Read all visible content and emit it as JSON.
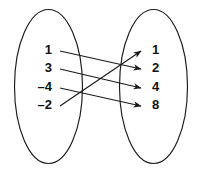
{
  "figure": {
    "kind": "mapping-diagram",
    "background_color": "#ffffff",
    "stroke_color": "#1a1a1a",
    "text_color": "#111111"
  },
  "domain_set": {
    "name": "domain-set",
    "elements": [
      {
        "label": "1",
        "x": 52,
        "y": 51
      },
      {
        "label": "3",
        "x": 52,
        "y": 69
      },
      {
        "label": "–4",
        "x": 52,
        "y": 88
      },
      {
        "label": "–2",
        "x": 52,
        "y": 106
      }
    ],
    "ellipse": {
      "cx": 48.5,
      "cy": 86.5,
      "rx": 34,
      "ry": 77
    }
  },
  "range_set": {
    "name": "range-set",
    "elements": [
      {
        "label": "1",
        "x": 152,
        "y": 51
      },
      {
        "label": "2",
        "x": 152,
        "y": 69
      },
      {
        "label": "4",
        "x": 152,
        "y": 88
      },
      {
        "label": "8",
        "x": 152,
        "y": 106
      }
    ],
    "ellipse": {
      "cx": 153.5,
      "cy": 86.5,
      "rx": 34,
      "ry": 77
    }
  },
  "mappings": [
    {
      "from": "1",
      "to": "2",
      "x1": 60,
      "y1": 51,
      "x2": 141,
      "y2": 69
    },
    {
      "from": "3",
      "to": "4",
      "x1": 60,
      "y1": 69,
      "x2": 141,
      "y2": 88
    },
    {
      "from": "–4",
      "to": "8",
      "x1": 60,
      "y1": 88,
      "x2": 141,
      "y2": 106
    },
    {
      "from": "–2",
      "to": "1",
      "x1": 60,
      "y1": 106,
      "x2": 141,
      "y2": 51
    }
  ],
  "chart_data": {
    "type": "diagram",
    "title": "",
    "left_set_values": [
      "1",
      "3",
      "-4",
      "-2"
    ],
    "right_set_values": [
      "1",
      "2",
      "4",
      "8"
    ],
    "edges": [
      {
        "from": "1",
        "to": "2"
      },
      {
        "from": "3",
        "to": "4"
      },
      {
        "from": "-4",
        "to": "8"
      },
      {
        "from": "-2",
        "to": "1"
      }
    ]
  }
}
